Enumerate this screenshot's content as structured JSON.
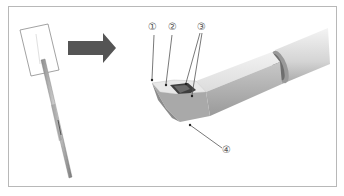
{
  "figure": {
    "labels": [
      {
        "id": "1",
        "text": "①"
      },
      {
        "id": "2",
        "text": "②"
      },
      {
        "id": "3",
        "text": "③"
      },
      {
        "id": "4",
        "text": "④"
      }
    ],
    "colors": {
      "border": "#b8b8b8",
      "arrow": "#555555",
      "metal_light": "#e6e6e6",
      "metal_mid": "#bdbdbd",
      "metal_dark": "#8a8a8a",
      "leader": "#555555"
    }
  }
}
